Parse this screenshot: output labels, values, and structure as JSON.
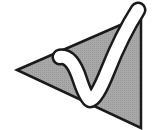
{
  "icon": {
    "name": "checkmark-triangle-icon",
    "colors": {
      "background": "#ffffff",
      "triangle_fill": "#a6a6a6",
      "outline": "#1a1a1a",
      "check_fill": "#ffffff"
    }
  }
}
